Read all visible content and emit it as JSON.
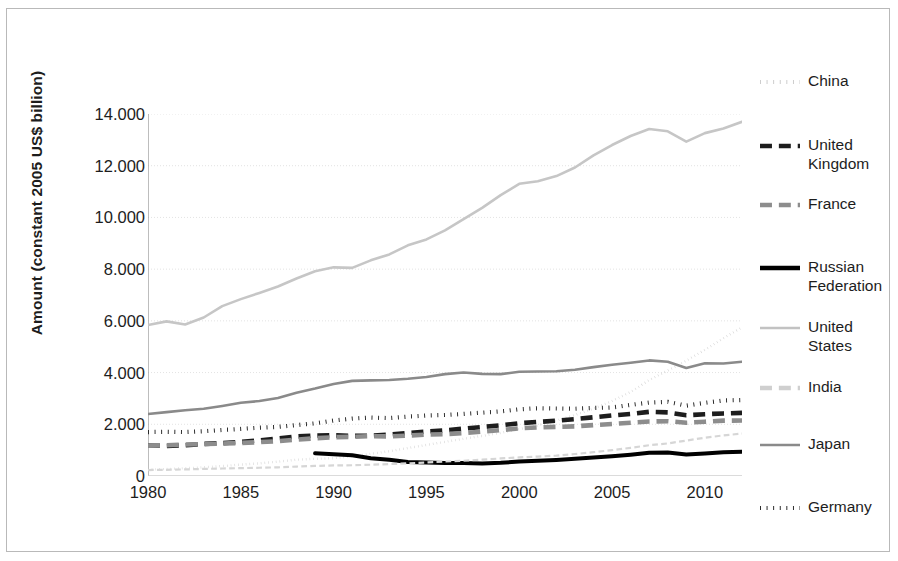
{
  "chart_data": {
    "type": "line",
    "title": "",
    "xlabel": "",
    "ylabel": "Amount (constant 2005 US$ billion)",
    "xlim": [
      1980,
      2012
    ],
    "ylim": [
      0,
      14000
    ],
    "grid": true,
    "legend_position": "right",
    "x_tick_labels": [
      "1980",
      "1985",
      "1990",
      "1995",
      "2000",
      "2005",
      "2010"
    ],
    "x_ticks": [
      1980,
      1985,
      1990,
      1995,
      2000,
      2005,
      2010
    ],
    "y_tick_labels": [
      "0",
      "2.000",
      "4.000",
      "6.000",
      "8.000",
      "10.000",
      "12.000",
      "14.000"
    ],
    "y_ticks": [
      0,
      2000,
      4000,
      6000,
      8000,
      10000,
      12000,
      14000
    ],
    "x": [
      1980,
      1981,
      1982,
      1983,
      1984,
      1985,
      1986,
      1987,
      1988,
      1989,
      1990,
      1991,
      1992,
      1993,
      1994,
      1995,
      1996,
      1997,
      1998,
      1999,
      2000,
      2001,
      2002,
      2003,
      2004,
      2005,
      2006,
      2007,
      2008,
      2009,
      2010,
      2011,
      2012
    ],
    "series": [
      {
        "name": "China",
        "style": "dotted",
        "color": "#cfcfcf",
        "width": 2.4,
        "values": [
          245,
          270,
          300,
          335,
          385,
          440,
          490,
          555,
          630,
          665,
          690,
          760,
          855,
          960,
          1080,
          1200,
          1320,
          1440,
          1550,
          1670,
          1810,
          1960,
          2140,
          2360,
          2600,
          2900,
          3250,
          3710,
          4080,
          4460,
          4880,
          5330,
          5750
        ]
      },
      {
        "name": "United Kingdom",
        "style": "dashed",
        "color": "#1d1d1d",
        "width": 4.6,
        "values": [
          1180,
          1160,
          1190,
          1240,
          1270,
          1320,
          1380,
          1450,
          1530,
          1565,
          1575,
          1555,
          1560,
          1600,
          1665,
          1720,
          1765,
          1830,
          1895,
          1960,
          2040,
          2090,
          2140,
          2200,
          2270,
          2340,
          2400,
          2480,
          2460,
          2350,
          2390,
          2420,
          2440
        ]
      },
      {
        "name": "France",
        "style": "dashed",
        "color": "#8d8d8d",
        "width": 4.6,
        "values": [
          1175,
          1190,
          1220,
          1235,
          1255,
          1280,
          1310,
          1345,
          1405,
          1460,
          1500,
          1515,
          1540,
          1530,
          1565,
          1600,
          1620,
          1660,
          1720,
          1775,
          1845,
          1880,
          1900,
          1920,
          1970,
          2010,
          2060,
          2110,
          2120,
          2060,
          2100,
          2140,
          2145
        ]
      },
      {
        "name": "Russian Federation",
        "style": "solid",
        "color": "#000000",
        "width": 4.0,
        "values": [
          null,
          null,
          null,
          null,
          null,
          null,
          null,
          null,
          null,
          880,
          845,
          800,
          685,
          625,
          545,
          520,
          500,
          505,
          480,
          510,
          560,
          590,
          620,
          665,
          715,
          765,
          825,
          900,
          910,
          830,
          870,
          915,
          935
        ]
      },
      {
        "name": "United States",
        "style": "solid",
        "color": "#c6c6c6",
        "width": 2.6,
        "values": [
          5840,
          5980,
          5860,
          6130,
          6570,
          6840,
          7080,
          7330,
          7640,
          7920,
          8070,
          8050,
          8340,
          8570,
          8920,
          9150,
          9500,
          9930,
          10370,
          10860,
          11300,
          11400,
          11600,
          11930,
          12400,
          12800,
          13150,
          13420,
          13330,
          12930,
          13260,
          13440,
          13700
        ]
      },
      {
        "name": "India",
        "style": "dashed",
        "color": "#d6d6d6",
        "width": 2.2,
        "values": [
          230,
          240,
          255,
          275,
          290,
          305,
          320,
          335,
          365,
          390,
          410,
          415,
          435,
          460,
          490,
          525,
          560,
          590,
          630,
          680,
          720,
          750,
          790,
          850,
          920,
          1000,
          1090,
          1190,
          1260,
          1370,
          1480,
          1570,
          1640
        ]
      },
      {
        "name": "Japan",
        "style": "solid",
        "color": "#8a8a8a",
        "width": 2.6,
        "values": [
          2400,
          2470,
          2540,
          2600,
          2710,
          2830,
          2900,
          3020,
          3220,
          3380,
          3560,
          3680,
          3700,
          3710,
          3760,
          3830,
          3940,
          4000,
          3950,
          3940,
          4030,
          4040,
          4050,
          4110,
          4210,
          4300,
          4380,
          4470,
          4420,
          4180,
          4360,
          4350,
          4420
        ]
      },
      {
        "name": "Germany",
        "style": "dotted",
        "color": "#1d1d1d",
        "width": 4.2,
        "values": [
          1700,
          1710,
          1700,
          1730,
          1780,
          1820,
          1870,
          1900,
          1970,
          2035,
          2145,
          2220,
          2260,
          2240,
          2295,
          2340,
          2360,
          2400,
          2450,
          2500,
          2580,
          2620,
          2610,
          2600,
          2630,
          2650,
          2750,
          2840,
          2870,
          2720,
          2830,
          2920,
          2940
        ]
      }
    ],
    "legend_entries": [
      {
        "label": "China",
        "style": "dotted",
        "color": "#c9c9c9"
      },
      {
        "label": "United\nKingdom",
        "style": "dashed",
        "color": "#1d1d1d"
      },
      {
        "label": "France",
        "style": "dashed",
        "color": "#8d8d8d"
      },
      {
        "label": "Russian\nFederation",
        "style": "solid",
        "color": "#000000"
      },
      {
        "label": "United\nStates",
        "style": "solid",
        "color": "#c2c2c2"
      },
      {
        "label": "India",
        "style": "dashed",
        "color": "#cfcfcf"
      },
      {
        "label": "Japan",
        "style": "solid",
        "color": "#8a8a8a"
      },
      {
        "label": "Germany",
        "style": "dotted",
        "color": "#1d1d1d"
      }
    ]
  }
}
